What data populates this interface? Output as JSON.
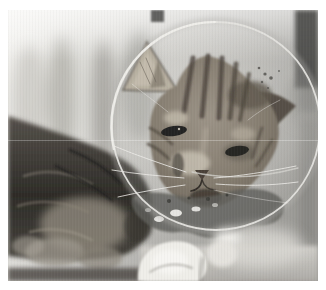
{
  "figure": {
    "type": "photograph",
    "alt": "A tabby cat wearing a transparent plastic Elizabethan recovery cone lies resting indoors beside a bright window, with a white towel beneath its chin",
    "setting": "indoors near bright window light",
    "frame_color": "#ffffff",
    "palette": {
      "bg_light": "#f4f3f0",
      "bg_mid": "#9e9d99",
      "dark_band": "#4a4946",
      "body_fur_dark": "#2e2c28",
      "body_fur_mid": "#6f6a60",
      "body_fur_light": "#9a948a",
      "head_fur_base": "#8d8379",
      "head_fur_light": "#c9c2b4",
      "head_fur_dark": "#4d463d",
      "eye_dark": "#232220",
      "cone_haze": "#d8d7d3",
      "cone_rim": "#e4e3df",
      "cone_shadow": "#61605c",
      "glare_white": "#f3f2ee",
      "towel_white": "#efeee9",
      "surface_light": "#c6c4bf",
      "whisker": "#edece8",
      "speck": "#454440"
    }
  }
}
